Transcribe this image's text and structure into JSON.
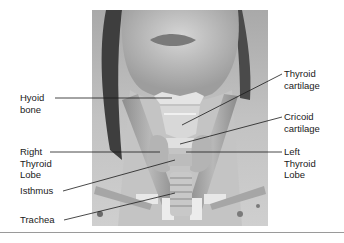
{
  "figure": {
    "labels": {
      "hyoid_bone": "Hyoid\nbone",
      "thyroid_cartilage": "Thyroid\ncartilage",
      "cricoid_cartilage": "Cricoid\ncartilage",
      "right_thyroid_lobe": "Right\nThyroid\nLobe",
      "left_thyroid_lobe": "Left\nThyroid\nLobe",
      "isthmus": "Isthmus",
      "trachea": "Trachea"
    },
    "colors": {
      "background": "#ffffff",
      "photo_tone": "#b5b5b5",
      "label_text": "#1a1a1a",
      "leader_line": "#1a1a1a",
      "separator": "#9a9a9a"
    }
  }
}
